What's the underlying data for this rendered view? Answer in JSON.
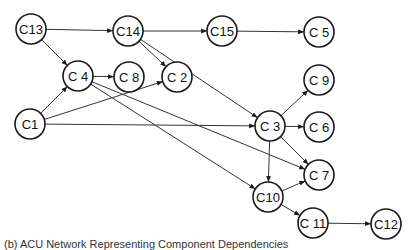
{
  "diagram": {
    "type": "directed-graph",
    "nodes": [
      {
        "id": "C13",
        "label": "C13",
        "x": 31,
        "y": 29
      },
      {
        "id": "C14",
        "label": "C14",
        "x": 128,
        "y": 31
      },
      {
        "id": "C15",
        "label": "C15",
        "x": 222,
        "y": 31
      },
      {
        "id": "C5",
        "label": "C 5",
        "x": 319,
        "y": 32
      },
      {
        "id": "C4",
        "label": "C 4",
        "x": 78,
        "y": 76
      },
      {
        "id": "C8",
        "label": "C 8",
        "x": 129,
        "y": 77
      },
      {
        "id": "C2",
        "label": "C 2",
        "x": 177,
        "y": 77
      },
      {
        "id": "C9",
        "label": "C 9",
        "x": 319,
        "y": 80
      },
      {
        "id": "C1",
        "label": "C1",
        "x": 30,
        "y": 124
      },
      {
        "id": "C3",
        "label": "C 3",
        "x": 270,
        "y": 126
      },
      {
        "id": "C6",
        "label": "C 6",
        "x": 319,
        "y": 127
      },
      {
        "id": "C7",
        "label": "C 7",
        "x": 319,
        "y": 175
      },
      {
        "id": "C10",
        "label": "C10",
        "x": 268,
        "y": 197
      },
      {
        "id": "C11",
        "label": "C 11",
        "x": 313,
        "y": 223
      },
      {
        "id": "C12",
        "label": "C12",
        "x": 386,
        "y": 224
      }
    ],
    "edges": [
      {
        "from": "C13",
        "to": "C14"
      },
      {
        "from": "C13",
        "to": "C4"
      },
      {
        "from": "C14",
        "to": "C15"
      },
      {
        "from": "C15",
        "to": "C5"
      },
      {
        "from": "C14",
        "to": "C2"
      },
      {
        "from": "C14",
        "to": "C3"
      },
      {
        "from": "C4",
        "to": "C8"
      },
      {
        "from": "C4",
        "to": "C7"
      },
      {
        "from": "C4",
        "to": "C10"
      },
      {
        "from": "C1",
        "to": "C4"
      },
      {
        "from": "C1",
        "to": "C2"
      },
      {
        "from": "C1",
        "to": "C3"
      },
      {
        "from": "C3",
        "to": "C9"
      },
      {
        "from": "C3",
        "to": "C6"
      },
      {
        "from": "C3",
        "to": "C7"
      },
      {
        "from": "C3",
        "to": "C10"
      },
      {
        "from": "C10",
        "to": "C7"
      },
      {
        "from": "C10",
        "to": "C11"
      },
      {
        "from": "C11",
        "to": "C12"
      }
    ],
    "node_radius": 15,
    "stroke_color": "#1a1a1a",
    "edge_color": "#333333"
  },
  "caption": {
    "text": "(b) ACU Network Representing Component Dependencies"
  }
}
